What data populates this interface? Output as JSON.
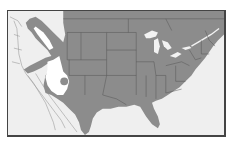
{
  "map": {
    "type": "range-map",
    "region": "North America (United States, southern Canada, northern Mexico)",
    "legend": null,
    "colors": {
      "background": "#efefef",
      "range_fill": "#8c8c8c",
      "excluded_area": "#ffffff",
      "state_borders": "#555555",
      "coast_lines": "#9a9a9a",
      "frame": "#444444"
    },
    "features": [
      {
        "name": "range",
        "description": "Shaded distribution covering most of the eastern and central United States, southern Canada, Texas, northeastern Mexico, and a band into the Pacific Northwest"
      },
      {
        "name": "western-exclusion",
        "description": "White unoccupied area over the Great Basin / southwest with a small shaded dot inside"
      },
      {
        "name": "great-lakes",
        "description": "Light lakes within the shaded range"
      }
    ]
  }
}
